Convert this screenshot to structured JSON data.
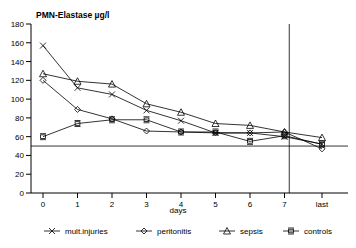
{
  "chart_data": {
    "type": "line",
    "title": "PMN-Elastase µg/l",
    "xlabel": "days",
    "ylabel": "",
    "ylim": [
      0,
      180
    ],
    "ytick_step": 20,
    "yticks": [
      "0",
      "20",
      "40",
      "60",
      "80",
      "100",
      "120",
      "140",
      "160",
      "180"
    ],
    "categories": [
      "0",
      "1",
      "2",
      "3",
      "4",
      "5",
      "6",
      "7",
      "last"
    ],
    "xticks": [
      "0",
      "1",
      "2",
      "3",
      "4",
      "5",
      "6",
      "7",
      "last"
    ],
    "grid": false,
    "legend_position": "bottom",
    "reference_line_y": 50,
    "separator_after_category": "7",
    "series": [
      {
        "name": "mult.injuries",
        "marker": "cross-x",
        "values": [
          157,
          112,
          105,
          88,
          77,
          64,
          64,
          60,
          52
        ]
      },
      {
        "name": "peritonitis",
        "marker": "diamond",
        "values": [
          120,
          89,
          79,
          66,
          65,
          64,
          64,
          65,
          47
        ]
      },
      {
        "name": "sepsis",
        "marker": "triangle",
        "values": [
          127,
          119,
          116,
          95,
          86,
          74,
          72,
          65,
          59
        ]
      },
      {
        "name": "controls",
        "marker": "bar-square",
        "values": [
          60,
          74,
          78,
          78,
          65,
          65,
          55,
          61,
          52
        ]
      }
    ]
  },
  "legend": {
    "items": [
      {
        "label": "mult.injuries"
      },
      {
        "label": "peritonitis"
      },
      {
        "label": "sepsis"
      },
      {
        "label": "controls"
      }
    ]
  }
}
